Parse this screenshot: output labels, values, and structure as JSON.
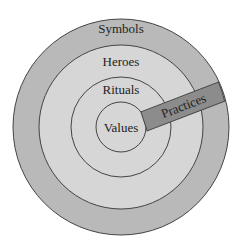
{
  "diagram": {
    "type": "concentric-onion",
    "layers": [
      {
        "name": "symbols",
        "label": "Symbols",
        "fill": "#b9b9b9"
      },
      {
        "name": "heroes",
        "label": "Heroes",
        "fill": "#d6d6d6"
      },
      {
        "name": "rituals",
        "label": "Rituals",
        "fill": "#d6d6d6"
      },
      {
        "name": "values",
        "label": "Values",
        "fill": "#d6d6d6"
      }
    ],
    "practices": {
      "label": "Practices",
      "fill": "#8c8c8c"
    },
    "stroke": "#444444"
  }
}
